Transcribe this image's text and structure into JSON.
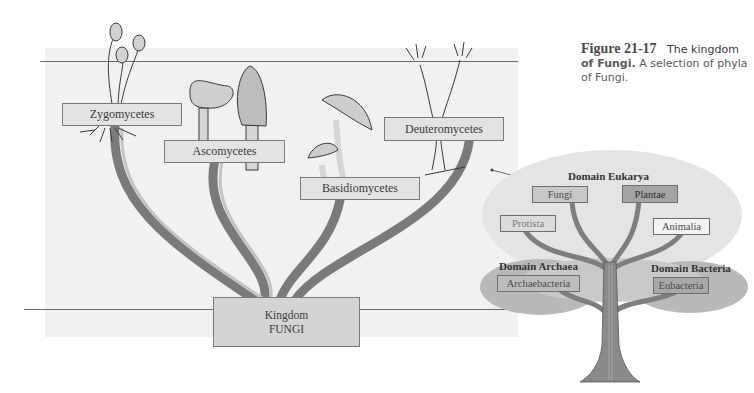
{
  "caption": {
    "figure_number": "Figure 21-17",
    "title_lead": "The kingdom",
    "title_bold": "of Fungi.",
    "text": "A selection of phyla of Fungi."
  },
  "fungi_tree": {
    "root": {
      "line1": "Kingdom",
      "line2": "FUNGI"
    },
    "phyla": [
      {
        "name": "Zygomycetes"
      },
      {
        "name": "Ascomycetes"
      },
      {
        "name": "Basidiomycetes"
      },
      {
        "name": "Deuteromycetes"
      }
    ]
  },
  "tree_of_life": {
    "domains": [
      {
        "name": "Domain Eukarya",
        "kingdoms": [
          "Fungi",
          "Plantae",
          "Protista",
          "Animalia"
        ]
      },
      {
        "name": "Domain Archaea",
        "kingdoms": [
          "Archaebacteria"
        ]
      },
      {
        "name": "Domain Bacteria",
        "kingdoms": [
          "Eubacteria"
        ]
      }
    ],
    "highlighted": "Fungi"
  },
  "colors": {
    "branch": "#7a7a7a",
    "panel": "#f1f1f1",
    "label_fill": "#e3e3e3",
    "foliage": "#c9c9c9",
    "foliage_dark": "#a9a9a9"
  }
}
